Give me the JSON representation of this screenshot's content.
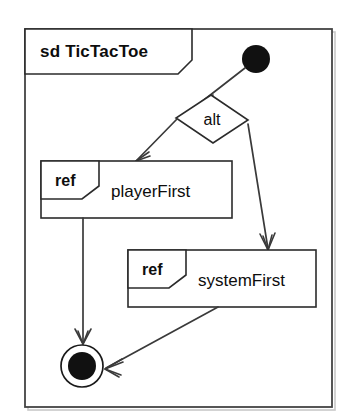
{
  "diagram": {
    "kind": "uml-interaction-overview-diagram",
    "frame": {
      "label": "sd TicTacToe",
      "keyword": "sd",
      "name": "TicTacToe"
    },
    "nodes": {
      "initial": {
        "type": "initial-node",
        "label": ""
      },
      "decision": {
        "type": "decision-node",
        "label": "alt"
      },
      "ref_player": {
        "type": "interaction-use",
        "tag": "ref",
        "label": "playerFirst"
      },
      "ref_system": {
        "type": "interaction-use",
        "tag": "ref",
        "label": "systemFirst"
      },
      "final": {
        "type": "final-node",
        "label": ""
      }
    },
    "edges": [
      {
        "from": "initial",
        "to": "decision",
        "label": ""
      },
      {
        "from": "decision",
        "to": "ref_player",
        "label": ""
      },
      {
        "from": "decision",
        "to": "ref_system",
        "label": ""
      },
      {
        "from": "ref_player",
        "to": "final",
        "label": ""
      },
      {
        "from": "ref_system",
        "to": "final",
        "label": ""
      }
    ],
    "colors": {
      "background": "#ffffff",
      "stroke": "#2b2b2b",
      "edge": "#3a3a3a",
      "node_fill": "#111111",
      "frame_stroke": "#444444"
    }
  }
}
